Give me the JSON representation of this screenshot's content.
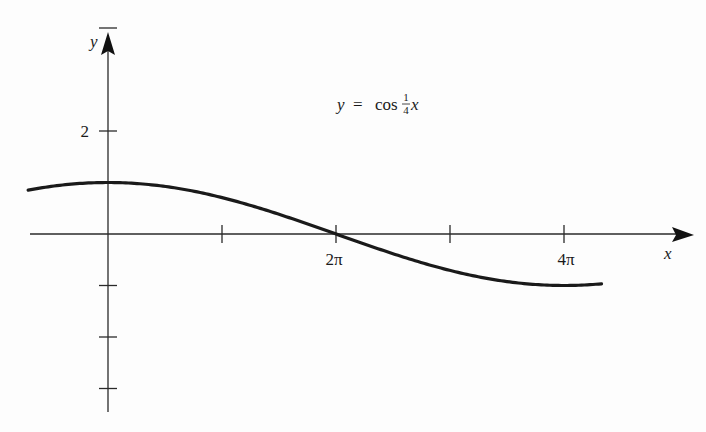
{
  "chart_data": {
    "type": "line",
    "equation": {
      "lhs": "y",
      "eq": "=",
      "func": "cos",
      "frac_num": "1",
      "frac_den": "4",
      "var": "x"
    },
    "xlabel": "x",
    "ylabel": "y",
    "x_ticks": [
      {
        "value": 3.14159,
        "label": ""
      },
      {
        "value": 6.28319,
        "label": "2π"
      },
      {
        "value": 9.42478,
        "label": ""
      },
      {
        "value": 12.56637,
        "label": "4π"
      }
    ],
    "y_ticks": [
      {
        "value": 4,
        "label": ""
      },
      {
        "value": 2,
        "label": "2"
      },
      {
        "value": -1,
        "label": ""
      },
      {
        "value": -2,
        "label": ""
      },
      {
        "value": -3,
        "label": ""
      }
    ],
    "xlim": [
      -2.2,
      15.9
    ],
    "ylim": [
      -3.5,
      4.9
    ],
    "series": [
      {
        "name": "y = cos(x/4)",
        "x_range": [
          -2.2,
          13.6
        ],
        "function": "cos(x/4)"
      }
    ],
    "grid": false,
    "legend": "none",
    "colors": {
      "curve": "#1a1a1a",
      "axis": "#2a2a2a"
    }
  }
}
